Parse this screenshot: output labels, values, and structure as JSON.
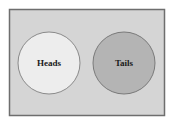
{
  "diagram": {
    "type": "venn",
    "sample_space": {
      "fill": "#d5d5d5",
      "stroke": "#6e6e6e"
    },
    "events": [
      {
        "label": "Heads",
        "fill": "#ededed",
        "stroke": "#8a8a8a"
      },
      {
        "label": "Tails",
        "fill": "#b4b4b4",
        "stroke": "#7a7a7a"
      }
    ],
    "overlap": false
  }
}
